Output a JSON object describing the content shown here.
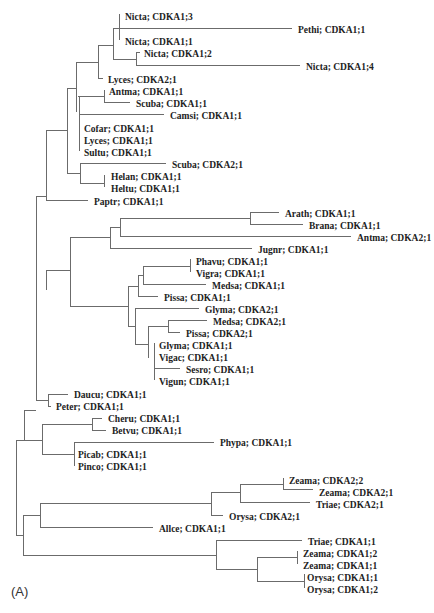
{
  "figure": {
    "panel_label": "(A)",
    "type": "phylogenetic-tree",
    "line_color": "#6b6b6b",
    "text_color": "#222222"
  },
  "leaves": [
    {
      "label": "Nicta; CDKA1;3",
      "x": 123,
      "y": 17
    },
    {
      "label": "Pethi; CDKA1;1",
      "x": 296,
      "y": 30
    },
    {
      "label": "Nicta; CDKA1;1",
      "x": 123,
      "y": 42
    },
    {
      "label": "Nicta; CDKA1;2",
      "x": 142,
      "y": 54
    },
    {
      "label": "Nicta; CDKA1;4",
      "x": 304,
      "y": 67
    },
    {
      "label": "Lyces; CDKA2;1",
      "x": 106,
      "y": 80
    },
    {
      "label": "Antma; CDKA1;1",
      "x": 107,
      "y": 92
    },
    {
      "label": "Scuba; CDKA1;1",
      "x": 134,
      "y": 104
    },
    {
      "label": "Camsi; CDKA1;1",
      "x": 168,
      "y": 116
    },
    {
      "label": "Cofar; CDKA1;1",
      "x": 82,
      "y": 129
    },
    {
      "label": "Lyces; CDKA1;1",
      "x": 82,
      "y": 141
    },
    {
      "label": "Sultu; CDKA1;1",
      "x": 82,
      "y": 153
    },
    {
      "label": "Scuba; CDKA2;1",
      "x": 170,
      "y": 165
    },
    {
      "label": "Helan; CDKA1;1",
      "x": 109,
      "y": 177
    },
    {
      "label": "Heltu; CDKA1;1",
      "x": 109,
      "y": 189
    },
    {
      "label": "Paptr; CDKA1;1",
      "x": 92,
      "y": 202
    },
    {
      "label": "Arath; CDKA1;1",
      "x": 283,
      "y": 214
    },
    {
      "label": "Brana; CDKA1;1",
      "x": 307,
      "y": 226
    },
    {
      "label": "Antma; CDKA2;1",
      "x": 355,
      "y": 238
    },
    {
      "label": "Jugnr; CDKA1;1",
      "x": 256,
      "y": 250
    },
    {
      "label": "Phavu; CDKA1;1",
      "x": 194,
      "y": 262
    },
    {
      "label": "Vigra; CDKA1;1",
      "x": 194,
      "y": 274
    },
    {
      "label": "Medsa; CDKA1;1",
      "x": 210,
      "y": 286
    },
    {
      "label": "Pissa; CDKA1;1",
      "x": 162,
      "y": 298
    },
    {
      "label": "Glyma; CDKA2;1",
      "x": 203,
      "y": 310
    },
    {
      "label": "Medsa; CDKA2;1",
      "x": 211,
      "y": 322
    },
    {
      "label": "Pissa; CDKA2;1",
      "x": 184,
      "y": 334
    },
    {
      "label": "Glyma; CDKA1;1",
      "x": 157,
      "y": 346
    },
    {
      "label": "Vigac; CDKA1;1",
      "x": 157,
      "y": 358
    },
    {
      "label": "Sesro; CDKA1;1",
      "x": 184,
      "y": 370
    },
    {
      "label": "Vigun; CDKA1;1",
      "x": 157,
      "y": 382
    },
    {
      "label": "Daucu; CDKA1;1",
      "x": 72,
      "y": 395
    },
    {
      "label": "Peter; CDKA1;1",
      "x": 54,
      "y": 407
    },
    {
      "label": "Cheru; CDKA1;1",
      "x": 106,
      "y": 419
    },
    {
      "label": "Betvu; CDKA1;1",
      "x": 110,
      "y": 431
    },
    {
      "label": "Phypa; CDKA1;1",
      "x": 218,
      "y": 443
    },
    {
      "label": "Picab; CDKA1;1",
      "x": 76,
      "y": 455
    },
    {
      "label": "Pinco; CDKA1;1",
      "x": 76,
      "y": 467
    },
    {
      "label": "Zeama; CDKA2;2",
      "x": 287,
      "y": 481
    },
    {
      "label": "Zeama; CDKA2;1",
      "x": 317,
      "y": 493
    },
    {
      "label": "Triae; CDKA2;1",
      "x": 314,
      "y": 505
    },
    {
      "label": "Orysa; CDKA2;1",
      "x": 227,
      "y": 517
    },
    {
      "label": "Allce; CDKA1;1",
      "x": 157,
      "y": 529
    },
    {
      "label": "Triae; CDKA1;1",
      "x": 306,
      "y": 542
    },
    {
      "label": "Zeama; CDKA1;2",
      "x": 301,
      "y": 554
    },
    {
      "label": "Zeama; CDKA1;1",
      "x": 301,
      "y": 566
    },
    {
      "label": "Orysa; CDKA1;1",
      "x": 305,
      "y": 578
    },
    {
      "label": "Orysa; CDKA1;2",
      "x": 305,
      "y": 590
    }
  ],
  "branches": [
    [
      119,
      14,
      119,
      40
    ],
    [
      119,
      28,
      292,
      28
    ],
    [
      113,
      28,
      119,
      28
    ],
    [
      136,
      52,
      140,
      52
    ],
    [
      136,
      52,
      136,
      65
    ],
    [
      136,
      65,
      300,
      65
    ],
    [
      113,
      28,
      113,
      59
    ],
    [
      113,
      59,
      136,
      59
    ],
    [
      98,
      45,
      113,
      45
    ],
    [
      98,
      45,
      98,
      78
    ],
    [
      98,
      78,
      103,
      78
    ],
    [
      76,
      62,
      98,
      62
    ],
    [
      78,
      96,
      104,
      96
    ],
    [
      104,
      90,
      104,
      102
    ],
    [
      104,
      102,
      130,
      102
    ],
    [
      79,
      114,
      164,
      114
    ],
    [
      79,
      96,
      79,
      151
    ],
    [
      76,
      62,
      76,
      112
    ],
    [
      67,
      88,
      76,
      88
    ],
    [
      80,
      163,
      166,
      163
    ],
    [
      80,
      163,
      80,
      183
    ],
    [
      80,
      183,
      104,
      183
    ],
    [
      104,
      175,
      104,
      187
    ],
    [
      67,
      88,
      67,
      173
    ],
    [
      67,
      173,
      80,
      173
    ],
    [
      46,
      130,
      67,
      130
    ],
    [
      46,
      130,
      46,
      200
    ],
    [
      46,
      200,
      88,
      200
    ],
    [
      250,
      212,
      279,
      212
    ],
    [
      250,
      212,
      250,
      224
    ],
    [
      250,
      224,
      303,
      224
    ],
    [
      120,
      218,
      250,
      218
    ],
    [
      120,
      218,
      120,
      236
    ],
    [
      120,
      236,
      351,
      236
    ],
    [
      110,
      227,
      120,
      227
    ],
    [
      110,
      227,
      110,
      248
    ],
    [
      110,
      248,
      252,
      248
    ],
    [
      190,
      259,
      190,
      272
    ],
    [
      143,
      266,
      190,
      266
    ],
    [
      143,
      266,
      143,
      284
    ],
    [
      143,
      284,
      206,
      284
    ],
    [
      138,
      275,
      143,
      275
    ],
    [
      138,
      275,
      138,
      296
    ],
    [
      138,
      296,
      158,
      296
    ],
    [
      168,
      320,
      168,
      332
    ],
    [
      168,
      320,
      207,
      320
    ],
    [
      168,
      332,
      180,
      332
    ],
    [
      148,
      326,
      168,
      326
    ],
    [
      148,
      326,
      148,
      358
    ],
    [
      154,
      343,
      154,
      380
    ],
    [
      154,
      368,
      180,
      368
    ],
    [
      135,
      308,
      199,
      308
    ],
    [
      135,
      308,
      135,
      344
    ],
    [
      135,
      344,
      148,
      344
    ],
    [
      128,
      286,
      138,
      286
    ],
    [
      128,
      286,
      128,
      326
    ],
    [
      128,
      326,
      135,
      326
    ],
    [
      70,
      237,
      110,
      237
    ],
    [
      70,
      237,
      70,
      306
    ],
    [
      70,
      306,
      128,
      306
    ],
    [
      46,
      270,
      70,
      270
    ],
    [
      46,
      270,
      46,
      290
    ],
    [
      36,
      196,
      46,
      196
    ],
    [
      36,
      196,
      36,
      400
    ],
    [
      48,
      394,
      68,
      394
    ],
    [
      48,
      394,
      48,
      406
    ],
    [
      48,
      406,
      51,
      406
    ],
    [
      36,
      400,
      48,
      400
    ],
    [
      92,
      418,
      102,
      418
    ],
    [
      92,
      418,
      92,
      430
    ],
    [
      92,
      430,
      106,
      430
    ],
    [
      74,
      442,
      214,
      442
    ],
    [
      74,
      442,
      74,
      466
    ],
    [
      42,
      424,
      92,
      424
    ],
    [
      42,
      424,
      42,
      454
    ],
    [
      42,
      454,
      74,
      454
    ],
    [
      24,
      410,
      36,
      410
    ],
    [
      24,
      410,
      24,
      440
    ],
    [
      24,
      440,
      42,
      440
    ],
    [
      283,
      478,
      283,
      489
    ],
    [
      283,
      489,
      313,
      489
    ],
    [
      240,
      484,
      283,
      484
    ],
    [
      240,
      484,
      240,
      502
    ],
    [
      240,
      502,
      310,
      502
    ],
    [
      211,
      492,
      240,
      492
    ],
    [
      211,
      492,
      211,
      515
    ],
    [
      211,
      515,
      223,
      515
    ],
    [
      40,
      503,
      211,
      503
    ],
    [
      40,
      503,
      40,
      527
    ],
    [
      40,
      527,
      153,
      527
    ],
    [
      297,
      551,
      297,
      564
    ],
    [
      304,
      574,
      304,
      588
    ],
    [
      257,
      557,
      297,
      557
    ],
    [
      257,
      557,
      257,
      581
    ],
    [
      257,
      581,
      304,
      581
    ],
    [
      216,
      540,
      302,
      540
    ],
    [
      216,
      540,
      216,
      569
    ],
    [
      216,
      569,
      257,
      569
    ],
    [
      23,
      515,
      40,
      515
    ],
    [
      23,
      515,
      23,
      555
    ],
    [
      23,
      555,
      216,
      555
    ],
    [
      16,
      440,
      24,
      440
    ],
    [
      16,
      440,
      16,
      535
    ],
    [
      16,
      535,
      23,
      535
    ]
  ]
}
